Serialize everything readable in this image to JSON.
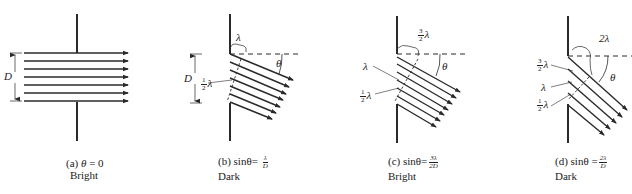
{
  "figure": {
    "panels": [
      {
        "id": "a",
        "caption_prefix": "(a)",
        "condition": "θ = 0",
        "condition_lhs": "θ",
        "condition_rhs": "= 0",
        "result": "Bright",
        "labels": {
          "slit_width": "D"
        }
      },
      {
        "id": "b",
        "caption_prefix": "(b)",
        "condition_lhs": "sinθ",
        "condition_eq": "=",
        "frac_num": "λ",
        "frac_den": "D",
        "result": "Dark",
        "labels": {
          "slit_width": "D",
          "path_top": "λ",
          "path_mid_coef_num": "1",
          "path_mid_coef_den": "2",
          "path_mid": "λ",
          "angle": "θ"
        }
      },
      {
        "id": "c",
        "caption_prefix": "(c)",
        "condition_lhs": "sinθ",
        "condition_eq": "=",
        "frac_num": "3λ",
        "frac_den": "2D",
        "result": "Bright",
        "labels": {
          "path_top_coef_num": "3",
          "path_top_coef_den": "2",
          "path_top": "λ",
          "path_mid": "λ",
          "path_low_coef_num": "1",
          "path_low_coef_den": "2",
          "path_low": "λ",
          "angle": "θ"
        }
      },
      {
        "id": "d",
        "caption_prefix": "(d)",
        "condition_lhs": "sinθ",
        "condition_eq": "=",
        "frac_num": "2λ",
        "frac_den": "D",
        "result": "Dark",
        "labels": {
          "path_top": "2λ",
          "path_a_coef_num": "3",
          "path_a_coef_den": "2",
          "path_a": "λ",
          "path_b": "λ",
          "path_c_coef_num": "1",
          "path_c_coef_den": "2",
          "path_c": "λ",
          "angle": "θ"
        }
      }
    ],
    "colors": {
      "line": "#2a2a2a",
      "text": "#222222",
      "leader": "#555555"
    }
  }
}
